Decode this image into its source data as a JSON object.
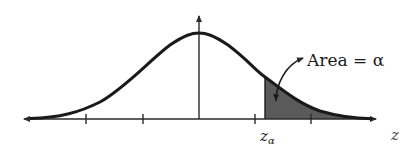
{
  "figure": {
    "type": "normal-distribution-diagram",
    "axis_label": "z",
    "critical_value_label": "z",
    "critical_value_subscript": "α",
    "area_annotation": "Area = α",
    "colors": {
      "curve": "#1a1a1a",
      "axis": "#2a2a2a",
      "shaded_region": "#5a5a5a",
      "background": "#ffffff"
    },
    "ticks_count": 4,
    "shaded_tail": "right"
  }
}
